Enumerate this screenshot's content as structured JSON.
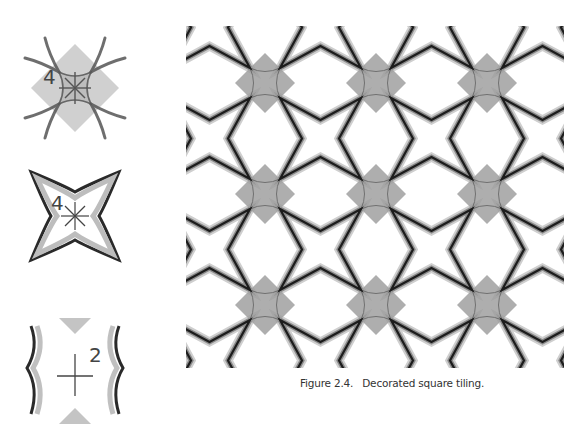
{
  "caption": {
    "label": "Figure 2.4.",
    "text": "Decorated square tiling."
  },
  "colors": {
    "stroke": "#1c1c1c",
    "stroke_soft": "#8a8a8a",
    "diamond_fill": "#9c9c9c",
    "background": "#ffffff"
  },
  "tiling": {
    "period": 111,
    "origin_x": 79,
    "origin_y": 57,
    "cols": 5,
    "rows": 5,
    "diamond_half": 30,
    "arc_corner": 15,
    "notch_inset": 37
  },
  "small_figures": [
    {
      "id": "fig-rotation-4-diamond",
      "symbol": "4",
      "center_type": "star",
      "x": 25,
      "y": 38,
      "size": 100,
      "label_pos": [
        20,
        46
      ]
    },
    {
      "id": "fig-rotation-4-star",
      "symbol": "4",
      "center_type": "star",
      "x": 25,
      "y": 166,
      "size": 100,
      "label_pos": [
        26,
        48
      ]
    },
    {
      "id": "fig-rotation-2-cross",
      "symbol": "2",
      "center_type": "cross",
      "x": 25,
      "y": 318,
      "size": 106,
      "label_pos": [
        70,
        36
      ]
    }
  ]
}
